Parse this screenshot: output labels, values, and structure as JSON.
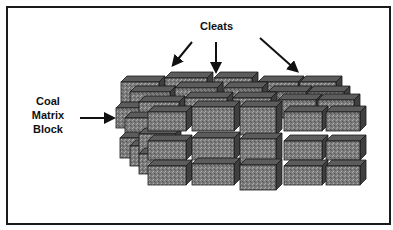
{
  "diagram": {
    "labels": {
      "cleats": "Cleats",
      "coal_line1": "Coal",
      "coal_line2": "Matrix",
      "coal_line3": "Block"
    },
    "colors": {
      "front": "#7a7a7a",
      "top": "#5c5c5c",
      "side": "#3f3f3f",
      "stroke": "#1a1a1a",
      "arrow": "#111111"
    },
    "arrows": [
      {
        "name": "cleats-arrow-left",
        "x1": 192,
        "y1": 42,
        "x2": 174,
        "y2": 64
      },
      {
        "name": "cleats-arrow-center",
        "x1": 216,
        "y1": 42,
        "x2": 216,
        "y2": 70
      },
      {
        "name": "cleats-arrow-right",
        "x1": 260,
        "y1": 38,
        "x2": 296,
        "y2": 70
      },
      {
        "name": "coal-matrix-arrow",
        "x1": 80,
        "y1": 118,
        "x2": 112,
        "y2": 118
      }
    ],
    "blocks": [
      {
        "x": 121,
        "y": 82,
        "w": 38,
        "h": 22,
        "d": 6
      },
      {
        "x": 165,
        "y": 78,
        "w": 42,
        "h": 20,
        "d": 6
      },
      {
        "x": 214,
        "y": 78,
        "w": 38,
        "h": 20,
        "d": 6
      },
      {
        "x": 258,
        "y": 82,
        "w": 40,
        "h": 18,
        "d": 6
      },
      {
        "x": 300,
        "y": 82,
        "w": 36,
        "h": 18,
        "d": 6
      },
      {
        "x": 130,
        "y": 92,
        "w": 40,
        "h": 22,
        "d": 6
      },
      {
        "x": 175,
        "y": 88,
        "w": 42,
        "h": 20,
        "d": 6
      },
      {
        "x": 224,
        "y": 88,
        "w": 38,
        "h": 20,
        "d": 6
      },
      {
        "x": 268,
        "y": 92,
        "w": 38,
        "h": 18,
        "d": 6
      },
      {
        "x": 308,
        "y": 92,
        "w": 36,
        "h": 18,
        "d": 6
      },
      {
        "x": 116,
        "y": 108,
        "w": 36,
        "h": 20,
        "d": 6
      },
      {
        "x": 139,
        "y": 102,
        "w": 40,
        "h": 22,
        "d": 6
      },
      {
        "x": 185,
        "y": 98,
        "w": 42,
        "h": 20,
        "d": 6
      },
      {
        "x": 233,
        "y": 98,
        "w": 38,
        "h": 20,
        "d": 6
      },
      {
        "x": 278,
        "y": 100,
        "w": 38,
        "h": 18,
        "d": 6
      },
      {
        "x": 318,
        "y": 100,
        "w": 36,
        "h": 18,
        "d": 6
      },
      {
        "x": 125,
        "y": 118,
        "w": 36,
        "h": 22,
        "d": 6
      },
      {
        "x": 120,
        "y": 138,
        "w": 36,
        "h": 20,
        "d": 6
      },
      {
        "x": 130,
        "y": 146,
        "w": 36,
        "h": 20,
        "d": 6
      },
      {
        "x": 139,
        "y": 134,
        "w": 36,
        "h": 20,
        "d": 6
      },
      {
        "x": 139,
        "y": 154,
        "w": 36,
        "h": 20,
        "d": 6
      },
      {
        "x": 148,
        "y": 112,
        "w": 38,
        "h": 19,
        "d": 6
      },
      {
        "x": 192,
        "y": 107,
        "w": 42,
        "h": 24,
        "d": 6
      },
      {
        "x": 240,
        "y": 107,
        "w": 36,
        "h": 28,
        "d": 6
      },
      {
        "x": 284,
        "y": 112,
        "w": 38,
        "h": 19,
        "d": 6
      },
      {
        "x": 326,
        "y": 112,
        "w": 34,
        "h": 19,
        "d": 6
      },
      {
        "x": 148,
        "y": 141,
        "w": 38,
        "h": 19,
        "d": 6
      },
      {
        "x": 192,
        "y": 138,
        "w": 42,
        "h": 22,
        "d": 6
      },
      {
        "x": 240,
        "y": 139,
        "w": 36,
        "h": 25,
        "d": 6
      },
      {
        "x": 284,
        "y": 141,
        "w": 38,
        "h": 19,
        "d": 6
      },
      {
        "x": 326,
        "y": 141,
        "w": 34,
        "h": 19,
        "d": 6
      },
      {
        "x": 148,
        "y": 166,
        "w": 38,
        "h": 19,
        "d": 6
      },
      {
        "x": 192,
        "y": 164,
        "w": 42,
        "h": 21,
        "d": 6
      },
      {
        "x": 240,
        "y": 165,
        "w": 36,
        "h": 25,
        "d": 6
      },
      {
        "x": 284,
        "y": 166,
        "w": 38,
        "h": 19,
        "d": 6
      },
      {
        "x": 326,
        "y": 166,
        "w": 34,
        "h": 19,
        "d": 6
      }
    ]
  }
}
